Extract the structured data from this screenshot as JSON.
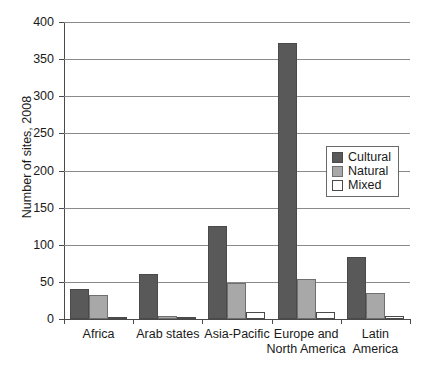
{
  "chart_data": {
    "type": "bar",
    "title": "",
    "xlabel": "",
    "ylabel": "Number of sites, 2008",
    "ylim": [
      0,
      400
    ],
    "ytick_labels": [
      "400",
      "350",
      "300",
      "250",
      "200",
      "150",
      "100",
      "50",
      "0"
    ],
    "ytick_values": [
      400,
      350,
      300,
      250,
      200,
      150,
      100,
      50,
      0
    ],
    "grid": true,
    "legend_position": "center-right",
    "categories": [
      "Africa",
      "Arab states",
      "Asia-Pacific",
      "Europe and North America",
      "Latin America"
    ],
    "category_lines": [
      [
        "Africa"
      ],
      [
        "Arab states"
      ],
      [
        "Asia-Pacific"
      ],
      [
        "Europe and",
        "North America"
      ],
      [
        "Latin",
        "America"
      ]
    ],
    "series": [
      {
        "name": "Cultural",
        "color": "#595959",
        "values": [
          40,
          60,
          125,
          372,
          83
        ]
      },
      {
        "name": "Natural",
        "color": "#a8a8a8",
        "values": [
          33,
          4,
          48,
          54,
          35
        ]
      },
      {
        "name": "Mixed",
        "color": "#ffffff",
        "values": [
          3,
          1,
          9,
          10,
          4
        ]
      }
    ]
  },
  "legend": {
    "entries": [
      {
        "label": "Cultural",
        "swatch": "cultural"
      },
      {
        "label": "Natural",
        "swatch": "natural"
      },
      {
        "label": "Mixed",
        "swatch": "mixed"
      }
    ]
  }
}
